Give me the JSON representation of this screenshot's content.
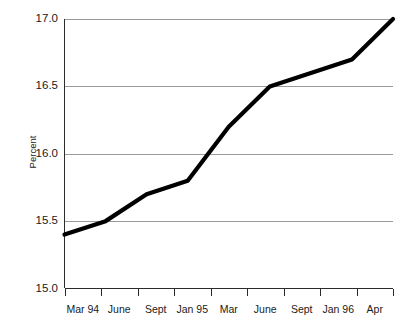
{
  "chart_data": {
    "type": "line",
    "title": "",
    "xlabel": "",
    "ylabel": "Percent",
    "ylim": [
      15.0,
      17.0
    ],
    "yticks": [
      "15.0",
      "15.5",
      "16.0",
      "16.5",
      "17.0"
    ],
    "ytick_values": [
      15.0,
      15.5,
      16.0,
      16.5,
      17.0
    ],
    "grid": "horizontal",
    "legend": "none",
    "categories": [
      "Mar 94",
      "June",
      "Sept",
      "Jan 95",
      "Mar",
      "June",
      "Sept",
      "Jan 96",
      "Apr"
    ],
    "values": [
      15.4,
      15.5,
      15.7,
      15.8,
      16.2,
      16.5,
      16.6,
      16.7,
      17.0
    ],
    "series": [
      {
        "name": "Percent",
        "color": "#000000",
        "values": [
          15.4,
          15.5,
          15.7,
          15.8,
          16.2,
          16.5,
          16.6,
          16.7,
          17.0
        ]
      }
    ],
    "colors": {
      "line": "#000000",
      "grid": "#9a9a9a",
      "axis": "#2b2b2b",
      "background": "#ffffff"
    }
  },
  "axis": {
    "y_labels": [
      {
        "text": "17.0",
        "value": 17.0
      },
      {
        "text": "16.5",
        "value": 16.5
      },
      {
        "text": "16.0",
        "value": 16.0
      },
      {
        "text": "15.5",
        "value": 15.5
      },
      {
        "text": "15.0",
        "value": 15.0
      }
    ],
    "x_labels": [
      {
        "text": "Mar 94"
      },
      {
        "text": "June"
      },
      {
        "text": "Sept"
      },
      {
        "text": "Jan 95"
      },
      {
        "text": "Mar"
      },
      {
        "text": "June"
      },
      {
        "text": "Sept"
      },
      {
        "text": "Jan 96"
      },
      {
        "text": "Apr"
      }
    ],
    "y_title": "Percent"
  }
}
